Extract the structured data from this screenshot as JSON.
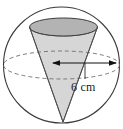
{
  "figure": {
    "dimension_label": "6 cm",
    "colors": {
      "background": "#ffffff",
      "outline": "#3b3b3b",
      "cone_fill": "#d4d4d4",
      "cone_top_fill": "#b5b5b5",
      "dashed_stroke": "#6e6e6e",
      "arrow": "#111111",
      "text": "#1a1a1a"
    },
    "geometry": {
      "sphere": {
        "cx": 61.5,
        "cy": 65,
        "r": 58
      },
      "equator_ellipse": {
        "cx": 61.5,
        "cy": 65,
        "rx": 58,
        "ry": 14,
        "style": "dashed"
      },
      "cone_top_ellipse": {
        "cx": 63.5,
        "cy": 27,
        "rx": 34,
        "ry": 9,
        "style": "solid"
      },
      "cone_apex": {
        "x": 63,
        "y": 122
      },
      "dimension_arrow": {
        "x1": 52,
        "x2": 117,
        "y": 63,
        "heads": "both"
      },
      "tick_line": {
        "x": 85,
        "y1": 63,
        "y2": 79
      }
    }
  }
}
